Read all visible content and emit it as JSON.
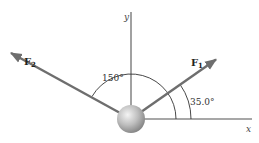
{
  "diagram": {
    "type": "force-vector-diagram",
    "axes": {
      "x_label": "x",
      "y_label": "y"
    },
    "forces": [
      {
        "label": "F",
        "subscript": "1",
        "angle_deg": 35.0,
        "angle_label": "35.0°",
        "reference": "from +x axis"
      },
      {
        "label": "F",
        "subscript": "2",
        "angle_deg": 150,
        "angle_label": "150°",
        "reference": "from +x axis"
      }
    ],
    "object": "sphere",
    "colors": {
      "arrow": "#6e6e6e",
      "axis": "#8a8a8a",
      "arc": "#333333",
      "sphere_light": "#f2f2f2",
      "sphere_dark": "#7a7a7a"
    }
  }
}
